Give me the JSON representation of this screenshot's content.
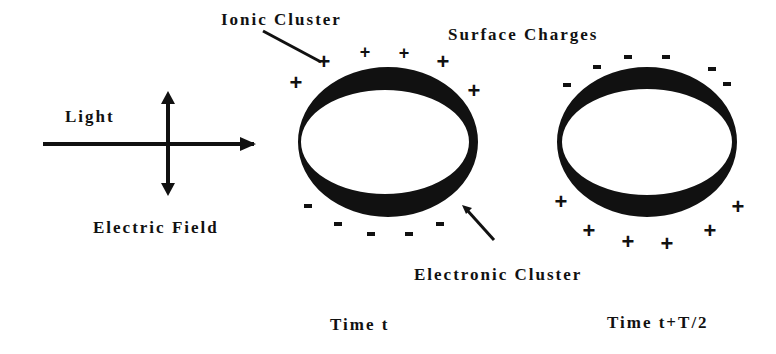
{
  "labels": {
    "ionic_cluster": "Ionic Cluster",
    "surface_charges": "Surface Charges",
    "light": "Light",
    "electric_field": "Electric Field",
    "electronic_cluster": "Electronic Cluster",
    "time_t": "Time t",
    "time_t_half": "Time t+T/2"
  },
  "charges": {
    "plus": "+",
    "minus": "-"
  },
  "colors": {
    "ink": "#111111",
    "background": "#ffffff"
  }
}
